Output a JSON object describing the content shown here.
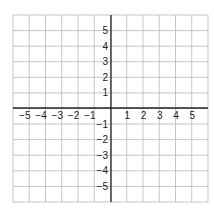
{
  "diagram": {
    "type": "coordinate-plane",
    "x_range": [
      -6,
      6
    ],
    "y_range": [
      -6,
      6
    ],
    "grid_color": "#b8b8b8",
    "axis_color": "#222222",
    "x_tick_labels": [
      "−5",
      "−4",
      "−3",
      "−2",
      "−1",
      "1",
      "2",
      "3",
      "4",
      "5"
    ],
    "y_tick_labels_positive": [
      "5",
      "4",
      "3",
      "2",
      "1"
    ],
    "y_tick_labels_negative": [
      "−1",
      "−2",
      "−3",
      "−4",
      "−5"
    ]
  }
}
